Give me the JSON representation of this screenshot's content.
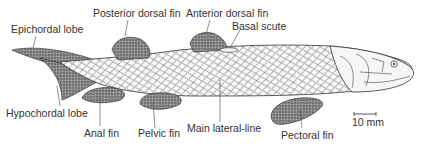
{
  "figure": {
    "labels": {
      "epichordal_lobe": "Epichordal lobe",
      "posterior_dorsal_fin": "Posterior dorsal fin",
      "anterior_dorsal_fin": "Anterior dorsal fin",
      "basal_scute": "Basal scute",
      "hypochordal_lobe": "Hypochordal lobe",
      "anal_fin": "Anal fin",
      "pelvic_fin": "Pelvic fin",
      "main_lateral_line": "Main lateral-line",
      "pectoral_fin": "Pectoral fin"
    },
    "scale_bar": {
      "label": "10 mm"
    },
    "colors": {
      "ink": "#333333",
      "fin_shade": "#6e6e6e",
      "scale_lines": "#555555",
      "background": "#ffffff"
    }
  }
}
